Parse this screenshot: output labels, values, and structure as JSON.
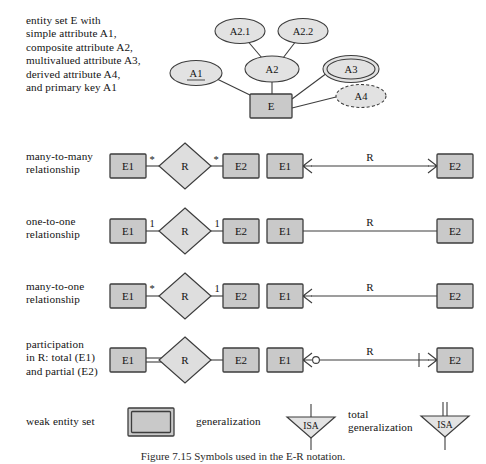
{
  "figure": {
    "caption": "Figure 7.15  Symbols used in the E-R notation."
  },
  "rows": [
    {
      "id": "entity-attributes",
      "label": "entity set E with\nsimple attribute A1,\ncomposite attribute A2,\nmultivalued attribute A3,\nderived attribute A4,\nand primary key A1",
      "entity": "E",
      "attributes": {
        "primary_key": "A1",
        "composite": "A2",
        "composite_parts": [
          "A2.1",
          "A2.2"
        ],
        "multivalued": "A3",
        "derived": "A4"
      }
    },
    {
      "id": "many-to-many",
      "label": "many-to-many\nrelationship",
      "left_entity": "E1",
      "relationship": "R",
      "right_entity": "E2",
      "left_cardinality": "*",
      "right_cardinality": "*",
      "alt_left_entity": "E1",
      "alt_relationship": "R",
      "alt_right_entity": "E2"
    },
    {
      "id": "one-to-one",
      "label": "one-to-one\nrelationship",
      "left_entity": "E1",
      "relationship": "R",
      "right_entity": "E2",
      "left_cardinality": "1",
      "right_cardinality": "1",
      "alt_left_entity": "E1",
      "alt_relationship": "R",
      "alt_right_entity": "E2"
    },
    {
      "id": "many-to-one",
      "label": "many-to-one\nrelationship",
      "left_entity": "E1",
      "relationship": "R",
      "right_entity": "E2",
      "left_cardinality": "*",
      "right_cardinality": "1",
      "alt_left_entity": "E1",
      "alt_relationship": "R",
      "alt_right_entity": "E2"
    },
    {
      "id": "participation",
      "label": "participation\nin R: total (E1)\nand partial (E2)",
      "left_entity": "E1",
      "relationship": "R",
      "right_entity": "E2",
      "left_cardinality": "",
      "right_cardinality": "",
      "alt_left_entity": "E1",
      "alt_relationship": "R",
      "alt_right_entity": "E2"
    }
  ],
  "bottom": {
    "weak_entity_label": "weak entity set",
    "generalization_label": "generalization",
    "total_generalization_label": "total\ngeneralization",
    "isa_label_1": "ISA",
    "isa_label_2": "ISA"
  },
  "colors": {
    "entity_fill": "#c9c9c9",
    "diamond_fill": "#dedede",
    "attribute_fill": "#e2e2e2",
    "stroke": "#3d3d3d",
    "text": "#141414"
  }
}
